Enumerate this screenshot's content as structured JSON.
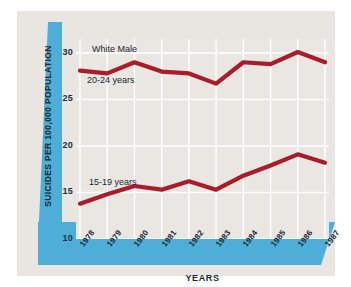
{
  "chart_data": {
    "type": "line",
    "title": "White Male",
    "xlabel": "YEARS",
    "ylabel": "SUICIDES PER 100,000 POPULATION",
    "categories": [
      "1978",
      "1979",
      "1980",
      "1981",
      "1982",
      "1983",
      "1984",
      "1985",
      "1986",
      "1987"
    ],
    "x": [
      1978,
      1979,
      1980,
      1981,
      1982,
      1983,
      1984,
      1985,
      1986,
      1987
    ],
    "series": [
      {
        "name": "20-24 years",
        "color": "#a81c2c",
        "values": [
          28.1,
          27.8,
          29.0,
          28.0,
          27.8,
          26.7,
          29.0,
          28.8,
          30.1,
          29.0
        ]
      },
      {
        "name": "15-19 years",
        "color": "#a81c2c",
        "values": [
          13.8,
          14.8,
          15.7,
          15.3,
          16.2,
          15.3,
          16.8,
          17.9,
          19.1,
          18.2
        ]
      }
    ],
    "ylim": [
      10,
      31.5
    ],
    "yticks": [
      10,
      15,
      20,
      25,
      30
    ],
    "ytick_labels": [
      "10",
      "15",
      "20",
      "25",
      "30"
    ],
    "xlim": [
      1978,
      1987
    ],
    "grid": true,
    "grid_color": "#ffffff",
    "legend": "inline-annotations",
    "legend_position": "in-plot",
    "annotations": [
      {
        "text": "White Male",
        "target": "chart-title"
      },
      {
        "text": "20-24 years",
        "target": "upper-series"
      },
      {
        "text": "15-19 years",
        "target": "lower-series"
      }
    ]
  },
  "colors": {
    "band_blue": "#4faed8",
    "band_blue_dark": "#3f9ecb",
    "line_red": "#a81c2c",
    "plot_background": "#eae6e1",
    "card_background": "#e9e5e0",
    "page_background": "#ffffff",
    "gridline": "#ffffff",
    "text_dark": "#1c2a33"
  },
  "axis": {
    "y_title": "SUICIDES PER 100,000 POPULATION",
    "x_title": "YEARS",
    "y_tick_labels": [
      "30",
      "25",
      "20",
      "15",
      "10"
    ],
    "x_tick_labels": [
      "1978",
      "1979",
      "1980",
      "1981",
      "1982",
      "1983",
      "1984",
      "1985",
      "1986",
      "1987"
    ]
  },
  "labels": {
    "chart_title": "White Male",
    "upper_series": "20-24 years",
    "lower_series": "15-19 years"
  }
}
